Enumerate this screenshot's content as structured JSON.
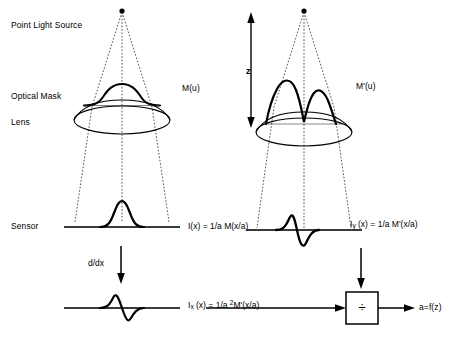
{
  "diagram": {
    "labels": {
      "point_light_source": "Point Light Source",
      "optical_mask": "Optical Mask",
      "lens": "Lens",
      "sensor": "Sensor",
      "mask_function_left": "M(u)",
      "mask_function_right": "M'(u)",
      "distance_z": "z",
      "derivative_operator": "d/dx",
      "divide_symbol": "÷",
      "output": "a=f(z)"
    },
    "equations": {
      "left_sensor": {
        "lhs": "I(x)",
        "eq": "=",
        "rhs": "1/a M(x/a)",
        "full": "I(x) = 1/a M(x/a)"
      },
      "right_sensor": {
        "lhs_base": "I",
        "lhs_sub": "y",
        "lhs_tail": " (x)",
        "eq": "=",
        "rhs": "1/a M'(x/a)",
        "full": "Iy (x) = 1/a M'(x/a)"
      },
      "left_derivative": {
        "lhs_base": "I",
        "lhs_sub": "x",
        "lhs_tail": " (x)",
        "eq": "=",
        "rhs_pre": "1/a ",
        "rhs_sup": "2",
        "rhs_post": "M'(x/a)",
        "full": "Ix (x) = 1/a 2M'(x/a)"
      }
    },
    "colors": {
      "stroke": "#000000",
      "background": "#ffffff",
      "ray_dashed": "#1a1a1a",
      "baseline": "#4d4d4d"
    },
    "elements": {
      "left_column": {
        "source_point": "point-light-source-dot",
        "mask_profile": "gaussian-bump",
        "lens_shape": "ellipse-lens",
        "sensor_line": "sensor-baseline",
        "sensor_profile": "narrow-gaussian",
        "derivative_profile": "odd-derivative-wavelet"
      },
      "right_column": {
        "source_point": "point-light-source-dot",
        "mask_profile": "double-lobe-derivative",
        "lens_shape": "ellipse-lens",
        "sensor_line": "sensor-baseline",
        "sensor_profile": "odd-derivative-wavelet"
      },
      "divider_block": "division-operator-box"
    }
  }
}
